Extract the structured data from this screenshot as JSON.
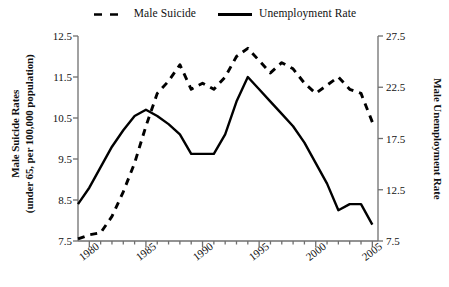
{
  "chart_data": {
    "type": "line",
    "title": "",
    "xlabel": "",
    "ylabel": "Male Suicide Rates\n(under 65, per 100,000 population)",
    "y2label": "Male Unemployment Rate",
    "xlim": [
      1979,
      2005.5
    ],
    "ylim": [
      7.5,
      12.5
    ],
    "y2lim": [
      7.5,
      27.5
    ],
    "grid": false,
    "legend_position": "top-center",
    "xticks": [
      1980,
      1985,
      1990,
      1995,
      2000,
      2005
    ],
    "xtick_labels": [
      "1980",
      "1985",
      "1990",
      "1995",
      "2000",
      "2005"
    ],
    "xminor_ticks_every": 1,
    "yticks": [
      7.5,
      8.5,
      9.5,
      10.5,
      11.5,
      12.5
    ],
    "ytick_labels": [
      "7.5",
      "8.5",
      "9.5",
      "10.5",
      "11.5",
      "12.5"
    ],
    "y2ticks": [
      7.5,
      12.5,
      17.5,
      22.5,
      27.5
    ],
    "y2tick_labels": [
      "7.5",
      "12.5",
      "17.5",
      "22.5",
      "27.5"
    ],
    "series": [
      {
        "name": "Male Suicide",
        "style": "dashed",
        "color": "#000000",
        "axis": "left",
        "x": [
          1979,
          1980,
          1981,
          1982,
          1983,
          1984,
          1985,
          1986,
          1987,
          1988,
          1989,
          1990,
          1991,
          1992,
          1993,
          1994,
          1995,
          1996,
          1997,
          1998,
          1999,
          2000,
          2001,
          2002,
          2003,
          2004,
          2005
        ],
        "values": [
          7.55,
          7.65,
          7.7,
          8.1,
          8.7,
          9.4,
          10.3,
          11.1,
          11.4,
          11.8,
          11.2,
          11.35,
          11.2,
          11.5,
          12.0,
          12.2,
          11.9,
          11.6,
          11.85,
          11.7,
          11.35,
          11.1,
          11.3,
          11.5,
          11.2,
          11.1,
          10.4
        ]
      },
      {
        "name": "Unemployment Rate",
        "style": "solid",
        "color": "#000000",
        "axis": "right",
        "x": [
          1979,
          1980,
          1981,
          1982,
          1983,
          1984,
          1985,
          1986,
          1987,
          1988,
          1989,
          1990,
          1991,
          1992,
          1993,
          1994,
          1995,
          1996,
          1997,
          1998,
          1999,
          2000,
          2001,
          2002,
          2003,
          2004,
          2005
        ],
        "values_left_scale": [
          8.4,
          8.8,
          9.3,
          9.8,
          10.2,
          10.6,
          10.75,
          10.6,
          10.4,
          10.1,
          9.6,
          9.6,
          9.6,
          10.1,
          10.9,
          11.5,
          11.2,
          10.9,
          10.6,
          10.3,
          9.9,
          9.4,
          8.9,
          8.25,
          8.4,
          8.4,
          7.9
        ],
        "values": [
          11.1,
          12.7,
          14.7,
          16.7,
          18.3,
          19.7,
          20.3,
          19.7,
          18.9,
          17.9,
          16.0,
          16.0,
          16.0,
          17.9,
          21.1,
          23.5,
          22.3,
          21.1,
          19.9,
          18.7,
          17.1,
          15.1,
          13.1,
          10.5,
          11.1,
          11.1,
          9.1
        ]
      }
    ]
  },
  "legend": {
    "entries": [
      {
        "label": "Male Suicide",
        "style": "dashed"
      },
      {
        "label": "Unemployment Rate",
        "style": "solid"
      }
    ]
  },
  "axes": {
    "left_title": "Male Suicide Rates (under 65, per 100,000 population)",
    "left_title_line1": "Male Suicide Rates",
    "left_title_line2": "(under 65, per 100,000 population)",
    "right_title": "Male Unemployment Rate"
  }
}
